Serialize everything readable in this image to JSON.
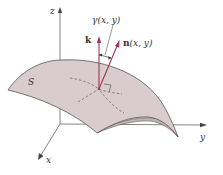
{
  "figure": {
    "axes": {
      "x_label": "x",
      "y_label": "y",
      "z_label": "z"
    },
    "surface": {
      "label": "S",
      "fill_color": "#d9ccce",
      "edge_color": "#555555"
    },
    "vectors": {
      "k": {
        "label": "k",
        "color": "#a0345a"
      },
      "n": {
        "label_bold": "n",
        "label_args": "(x, y)",
        "color": "#a0345a"
      }
    },
    "angle": {
      "label_symbol": "γ",
      "label_args": "(x, y)"
    },
    "colors": {
      "axis": "#666666",
      "dashed": "#444444",
      "text": "#333333"
    }
  }
}
